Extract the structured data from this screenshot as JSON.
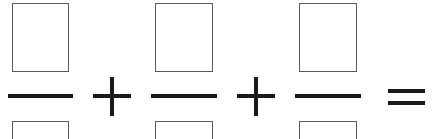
{
  "expression": {
    "description": "Sum of three fractions with empty numerator and denominator boxes",
    "fractions": [
      {
        "numerator": "",
        "denominator": ""
      },
      {
        "numerator": "",
        "denominator": ""
      },
      {
        "numerator": "",
        "denominator": ""
      }
    ],
    "operators": [
      "+",
      "+",
      "="
    ],
    "result": ""
  },
  "colors": {
    "box_border": "#5a5a5a",
    "stroke": "#1a1a1a",
    "background": "#ffffff"
  }
}
